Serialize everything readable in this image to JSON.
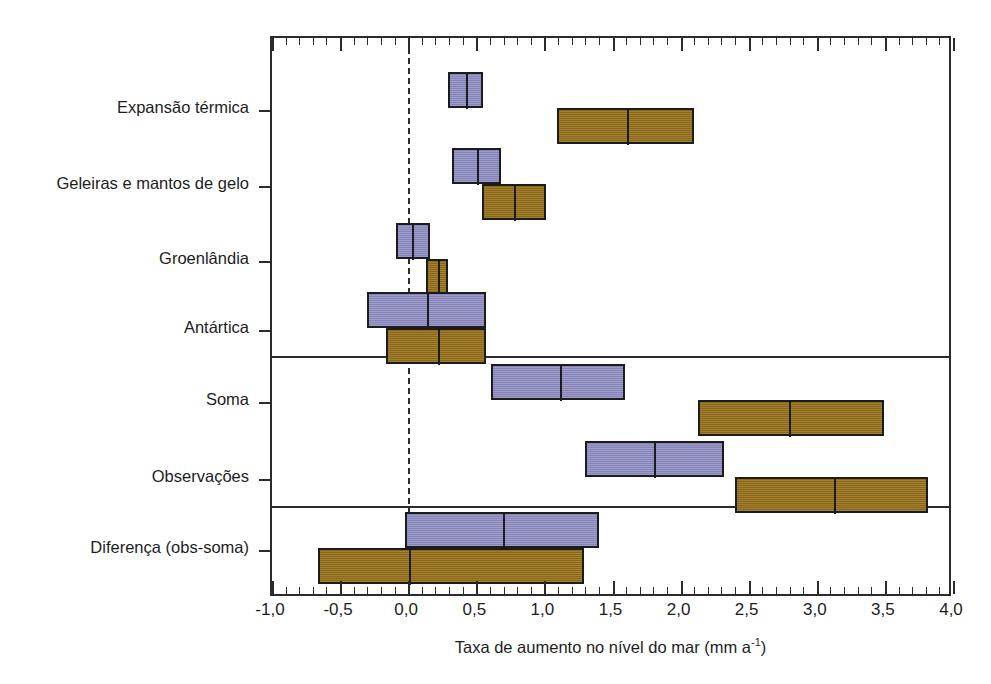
{
  "chart_data": {
    "type": "bar",
    "title": "",
    "subtitle": "",
    "xlabel_text": "Taxa de aumento no nível do mar (mm a",
    "xlabel_sup": "-1",
    "xlabel_tail": ")",
    "xlabel_full": "Taxa de aumento no nível do mar (mm a⁻¹)",
    "ylabel": "",
    "xlim": [
      -1.0,
      4.0
    ],
    "xticks": [
      -1.0,
      -0.5,
      0.0,
      0.5,
      1.0,
      1.5,
      2.0,
      2.5,
      3.0,
      3.5,
      4.0
    ],
    "xticklabels": [
      "-1,0",
      "-0,5",
      "0,0",
      "0,5",
      "1,0",
      "1,5",
      "2,0",
      "2,5",
      "3,0",
      "3,5",
      "4,0"
    ],
    "minor_tick_step": 0.1,
    "grid": false,
    "legend": null,
    "zero_reference_line": 0.0,
    "series": [
      {
        "name": "serie-roxa",
        "color": "#8d8cc2"
      },
      {
        "name": "serie-marrom",
        "color": "#96711a"
      }
    ],
    "categories": [
      "Expansão térmica",
      "Geleiras e mantos de gelo",
      "Groenlândia",
      "Antártica",
      "Soma",
      "Observações",
      "Diferença (obs-soma)"
    ],
    "group_separators_after": [
      "Antártica",
      "Observações"
    ],
    "rows": [
      {
        "label": "Expansão térmica",
        "bars": [
          {
            "series": "serie-roxa",
            "low": 0.29,
            "high": 0.55,
            "center": 0.42
          },
          {
            "series": "serie-marrom",
            "low": 1.09,
            "high": 2.1,
            "center": 1.6
          }
        ]
      },
      {
        "label": "Geleiras e mantos de gelo",
        "bars": [
          {
            "series": "serie-roxa",
            "low": 0.32,
            "high": 0.68,
            "center": 0.5
          },
          {
            "series": "serie-marrom",
            "low": 0.54,
            "high": 1.01,
            "center": 0.77
          }
        ]
      },
      {
        "label": "Groenlândia",
        "bars": [
          {
            "series": "serie-roxa",
            "low": -0.09,
            "high": 0.16,
            "center": 0.02
          },
          {
            "series": "serie-marrom",
            "low": 0.13,
            "high": 0.29,
            "center": 0.21
          }
        ]
      },
      {
        "label": "Antártica",
        "bars": [
          {
            "series": "serie-roxa",
            "low": -0.3,
            "high": 0.57,
            "center": 0.13
          },
          {
            "series": "serie-marrom",
            "low": -0.16,
            "high": 0.57,
            "center": 0.21
          }
        ]
      },
      {
        "label": "Soma",
        "bars": [
          {
            "series": "serie-roxa",
            "low": 0.61,
            "high": 1.59,
            "center": 1.11
          },
          {
            "series": "serie-marrom",
            "low": 2.13,
            "high": 3.49,
            "center": 2.79
          }
        ]
      },
      {
        "label": "Observações",
        "bars": [
          {
            "series": "serie-roxa",
            "low": 1.3,
            "high": 2.32,
            "center": 1.8
          },
          {
            "series": "serie-marrom",
            "low": 2.4,
            "high": 3.82,
            "center": 3.12
          }
        ]
      },
      {
        "label": "Diferença (obs-soma)",
        "bars": [
          {
            "series": "serie-roxa",
            "low": -0.02,
            "high": 1.4,
            "center": 0.69
          },
          {
            "series": "serie-marrom",
            "low": -0.66,
            "high": 1.29,
            "center": 0.0
          }
        ]
      }
    ],
    "colors": {
      "purple": "#8d8cc2",
      "brown": "#96711a",
      "outline": "#1c1c1c",
      "axis": "#2b2b2b",
      "background": "#ffffff"
    }
  }
}
